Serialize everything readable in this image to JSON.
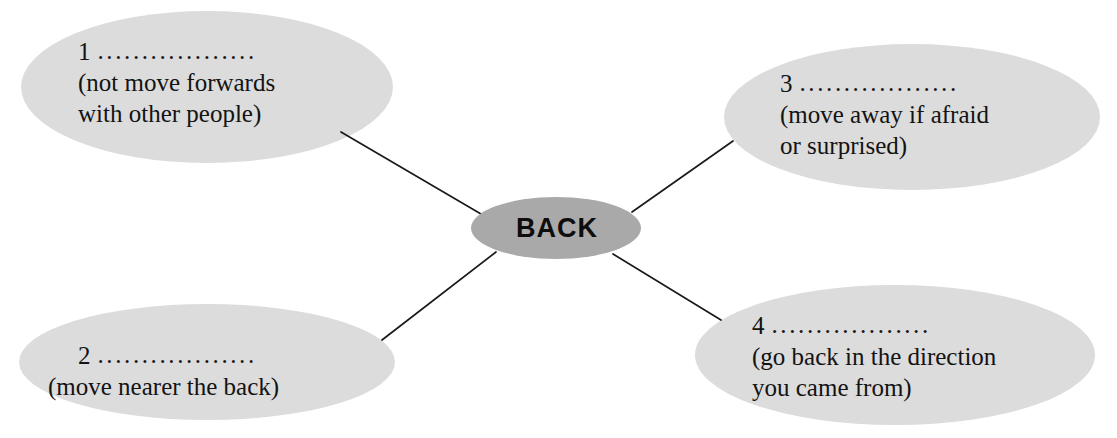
{
  "diagram": {
    "type": "mind-map",
    "background_color": "#ffffff",
    "center": {
      "label": "BACK",
      "fill_color": "#a9a9a9",
      "text_color": "#0d0d0d"
    },
    "node_fill_color": "#dcdcdc",
    "connector_color": "#1a1a1a",
    "branches": [
      {
        "number": "1",
        "blank": "..................",
        "gloss_lines": [
          "(not move forwards",
          "with other people)"
        ]
      },
      {
        "number": "2",
        "blank": "..................",
        "gloss_lines": [
          "(move nearer the back)"
        ]
      },
      {
        "number": "3",
        "blank": "..................",
        "gloss_lines": [
          "(move away if afraid",
          "or surprised)"
        ]
      },
      {
        "number": "4",
        "blank": "..................",
        "gloss_lines": [
          "(go back in the direction",
          "you came from)"
        ]
      }
    ]
  }
}
